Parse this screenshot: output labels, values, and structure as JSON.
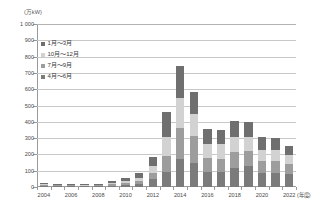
{
  "chart_data": {
    "type": "bar",
    "stacked": true,
    "title": "",
    "subtitle": "",
    "xlabel": "(年度)",
    "ylabel": "(万kW)",
    "unit_label": "(万kW)",
    "xaxis_unit": "(年度)",
    "ylim": [
      0,
      1000
    ],
    "ytick_step": 100,
    "grid": true,
    "legend_position": "inside-top-left",
    "categories": [
      "2004",
      "2005",
      "2006",
      "2007",
      "2008",
      "2009",
      "2010",
      "2011",
      "2012",
      "2013",
      "2014",
      "2015",
      "2016",
      "2017",
      "2018",
      "2019",
      "2020",
      "2021",
      "2022"
    ],
    "xtick_labels": [
      "2004",
      "",
      "2006",
      "",
      "2008",
      "",
      "2010",
      "",
      "2012",
      "",
      "2014",
      "",
      "2016",
      "",
      "2018",
      "",
      "2020",
      "",
      "2022"
    ],
    "ytick_labels": [
      "1 000",
      "900",
      "800",
      "700",
      "600",
      "500",
      "400",
      "300",
      "200",
      "100",
      "0"
    ],
    "ytick_values": [
      1000,
      900,
      800,
      700,
      600,
      500,
      400,
      300,
      200,
      100,
      0
    ],
    "series": [
      {
        "name": "4月～6月",
        "color": "#7b7b7b",
        "values": [
          7,
          6,
          6,
          4,
          5,
          8,
          12,
          20,
          48,
          92,
          170,
          150,
          95,
          90,
          118,
          128,
          88,
          88,
          80
        ]
      },
      {
        "name": "7月～9月",
        "color": "#9d9d9d",
        "values": [
          5,
          5,
          4,
          4,
          5,
          9,
          14,
          18,
          40,
          100,
          190,
          160,
          80,
          85,
          98,
          90,
          72,
          70,
          62
        ]
      },
      {
        "name": "10月～12月",
        "color": "#d2d2d2",
        "values": [
          4,
          4,
          4,
          3,
          4,
          7,
          11,
          16,
          38,
          115,
          185,
          135,
          88,
          86,
          92,
          86,
          68,
          68,
          55
        ]
      },
      {
        "name": "1月～3月",
        "color": "#6f6f6f",
        "values": [
          6,
          6,
          5,
          5,
          7,
          12,
          18,
          30,
          58,
          153,
          195,
          140,
          96,
          92,
          100,
          94,
          77,
          74,
          52
        ]
      }
    ],
    "totals": [
      22,
      21,
      19,
      16,
      21,
      36,
      55,
      84,
      184,
      460,
      740,
      585,
      359,
      353,
      408,
      398,
      305,
      300,
      249
    ],
    "legend_order_top_to_bottom": [
      "1月～3月",
      "10月～12月",
      "7月～9月",
      "4月～6月"
    ],
    "colors": {
      "axis": "#9a9a9a",
      "grid": "#c8c8c8",
      "text": "#4a4a4a",
      "jan_mar": "#6f6f6f",
      "oct_dec": "#d2d2d2",
      "jul_sep": "#9d9d9d",
      "apr_jun": "#7b7b7b"
    }
  }
}
